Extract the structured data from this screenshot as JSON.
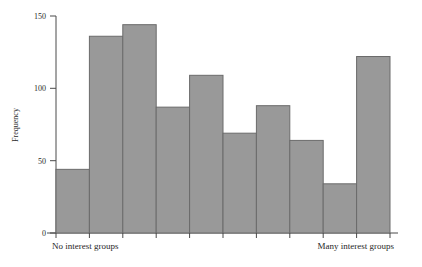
{
  "chart_data": {
    "type": "bar",
    "title": "",
    "subtitle": "",
    "xlabel": "",
    "ylabel": "Frequency",
    "xlim_labels": [
      "No interest groups",
      "Many interest groups"
    ],
    "ylim": [
      0,
      150
    ],
    "grid": false,
    "legend": false,
    "bar_color": "#999999",
    "bar_border_color": "#6b6b6b",
    "axis_color": "#4a4a4a",
    "y_ticks": [
      0,
      50,
      100,
      150
    ],
    "y_tick_labels": [
      "0",
      "50",
      "100",
      "150"
    ],
    "categories": [
      "1",
      "2",
      "3",
      "4",
      "5",
      "6",
      "7",
      "8",
      "9",
      "10"
    ],
    "values": [
      44,
      136,
      144,
      87,
      109,
      69,
      88,
      64,
      34,
      122
    ],
    "bins": 10,
    "x_tick_count": 11
  },
  "labels": {
    "y_axis_title": "Frequency",
    "x_left": "No interest groups",
    "x_right": "Many interest groups",
    "y_tick_0": "0",
    "y_tick_1": "50",
    "y_tick_2": "100",
    "y_tick_3": "150"
  }
}
